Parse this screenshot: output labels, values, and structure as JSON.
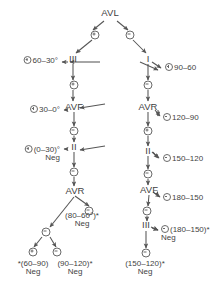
{
  "diagram": {
    "type": "decision-tree",
    "title": "",
    "root": "AVL",
    "nodes": [
      {
        "id": "avl",
        "label": "AVL",
        "x": 110,
        "y": 14
      },
      {
        "id": "iii",
        "label": "III",
        "x": 73,
        "y": 60
      },
      {
        "id": "i",
        "label": "I",
        "x": 148,
        "y": 60
      },
      {
        "id": "avf1",
        "label": "AVF",
        "x": 74,
        "y": 108
      },
      {
        "id": "avr2",
        "label": "AVR",
        "x": 148,
        "y": 108
      },
      {
        "id": "ii1",
        "label": "II",
        "x": 74,
        "y": 148
      },
      {
        "id": "ii2",
        "label": "II",
        "x": 148,
        "y": 152
      },
      {
        "id": "avr1",
        "label": "AVR",
        "x": 75,
        "y": 192
      },
      {
        "id": "avf2",
        "label": "AVF",
        "x": 149,
        "y": 191
      },
      {
        "id": "iii2",
        "label": "III",
        "x": 146,
        "y": 226
      }
    ],
    "branch_symbols": [
      {
        "id": "avl-pos",
        "sign": "plus",
        "x": 95,
        "y": 35
      },
      {
        "id": "avl-neg",
        "sign": "minus",
        "x": 130,
        "y": 35
      },
      {
        "id": "iii-pos",
        "sign": "plus",
        "x": 74,
        "y": 85
      },
      {
        "id": "i-neg",
        "sign": "minus",
        "x": 148,
        "y": 85
      },
      {
        "id": "avf1-neg",
        "sign": "minus",
        "x": 74,
        "y": 131
      },
      {
        "id": "avr2-plus",
        "sign": "plus",
        "x": 148,
        "y": 131
      },
      {
        "id": "ii1-neg",
        "sign": "minus",
        "x": 74,
        "y": 172
      },
      {
        "id": "ii2-neg",
        "sign": "minus",
        "x": 148,
        "y": 174
      },
      {
        "id": "avr1-neg",
        "sign": "minus",
        "x": 89,
        "y": 211
      },
      {
        "id": "avr1-branch",
        "sign": "minus",
        "x": 46,
        "y": 232
      },
      {
        "id": "avf2-neg",
        "sign": "minus",
        "x": 147,
        "y": 211
      },
      {
        "id": "branch-pos",
        "sign": "plus",
        "x": 33,
        "y": 252
      },
      {
        "id": "branch-neg",
        "sign": "minus",
        "x": 57,
        "y": 252
      },
      {
        "id": "iii2-neg",
        "sign": "minus",
        "x": 146,
        "y": 253
      }
    ],
    "leaves": [
      {
        "id": "leaf-60-30",
        "sign": "plus",
        "text": "60–30°",
        "neg": "",
        "x": 58,
        "y": 61,
        "align": "right"
      },
      {
        "id": "leaf-90-60",
        "sign": "plus",
        "text": "90–60",
        "neg": "",
        "x": 165,
        "y": 68,
        "align": "left"
      },
      {
        "id": "leaf-30-0",
        "sign": "plus",
        "text": "30–0°",
        "neg": "",
        "x": 60,
        "y": 110,
        "align": "right"
      },
      {
        "id": "leaf-120-90",
        "sign": "minus",
        "text": "120–90",
        "neg": "",
        "x": 163,
        "y": 118,
        "align": "left"
      },
      {
        "id": "leaf-0-30",
        "sign": "plus",
        "text": "(0–30)°",
        "neg": "Neg",
        "x": 60,
        "y": 150,
        "align": "right"
      },
      {
        "id": "leaf-150-120",
        "sign": "minus",
        "text": "150–120",
        "neg": "",
        "x": 163,
        "y": 159,
        "align": "left"
      },
      {
        "id": "leaf-80-60",
        "sign": "",
        "text": "(80–60°)*",
        "neg": "Neg",
        "x": 82,
        "y": 217,
        "align": "center"
      },
      {
        "id": "leaf-180-150a",
        "sign": "minus",
        "text": "180–150",
        "neg": "",
        "x": 163,
        "y": 198,
        "align": "left"
      },
      {
        "id": "leaf-180-150b",
        "sign": "minus",
        "text": "(180–150)*",
        "neg": "Neg",
        "x": 161,
        "y": 230,
        "align": "left"
      },
      {
        "id": "leaf-60-90",
        "sign": "",
        "text": "*(60–90)",
        "neg": "Neg",
        "x": 33,
        "y": 265,
        "align": "center"
      },
      {
        "id": "leaf-90-120",
        "sign": "",
        "text": "(90–120)*",
        "neg": "Neg",
        "x": 75,
        "y": 265,
        "align": "center"
      },
      {
        "id": "leaf-150-120b",
        "sign": "",
        "text": "(150–120)*",
        "neg": "Neg",
        "x": 145,
        "y": 265,
        "align": "center"
      }
    ],
    "colors": {
      "ink": "#3f3f3f",
      "line": "#6a6a6a",
      "background": "#ffffff"
    }
  }
}
